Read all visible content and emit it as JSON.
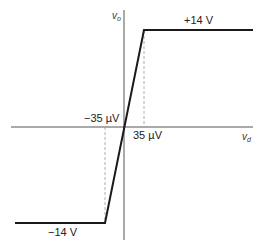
{
  "diagram": {
    "type": "op-amp voltage transfer characteristic",
    "axes": {
      "x_label": "v",
      "x_label_sub": "d",
      "y_label": "v",
      "y_label_sub": "o"
    },
    "labels": {
      "positive_saturation": "+14 V",
      "negative_saturation": "−14 V",
      "negative_threshold": "−35 µV",
      "positive_threshold": "35 µV"
    },
    "curve": {
      "points": [
        {
          "vd_uV": -Infinity,
          "vo_V": -14
        },
        {
          "vd_uV": -35,
          "vo_V": -14
        },
        {
          "vd_uV": 35,
          "vo_V": 14
        },
        {
          "vd_uV": Infinity,
          "vo_V": 14
        }
      ]
    },
    "colors": {
      "curve": "#1a1a1a",
      "axes": "#555555",
      "dashed": "#999999"
    }
  }
}
